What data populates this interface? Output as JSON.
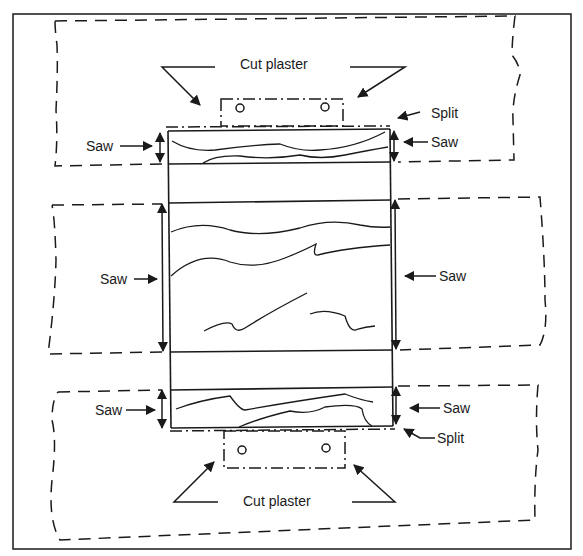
{
  "diagram": {
    "type": "technical-illustration",
    "colors": {
      "stroke": "#1a1a1a",
      "background": "#ffffff"
    },
    "labels": {
      "cut_plaster_top": "Cut plaster",
      "cut_plaster_bottom": "Cut plaster",
      "split_top": "Split",
      "split_bottom": "Split",
      "saw_top_left": "Saw",
      "saw_top_right": "Saw",
      "saw_middle_left": "Saw",
      "saw_middle_right": "Saw",
      "saw_bottom_left": "Saw",
      "saw_bottom_right": "Saw"
    },
    "regions": [
      {
        "name": "top-plaster-jacket",
        "style": "dashed"
      },
      {
        "name": "middle-plaster-jacket",
        "style": "dashed"
      },
      {
        "name": "bottom-plaster-jacket",
        "style": "dashed"
      },
      {
        "name": "top-cut-plaster-window",
        "style": "dash-dot",
        "holes": 2
      },
      {
        "name": "bottom-cut-plaster-window",
        "style": "dash-dot",
        "holes": 2
      }
    ]
  }
}
